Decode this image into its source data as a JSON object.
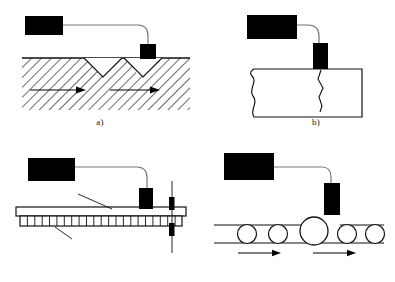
{
  "figure": {
    "width": 395,
    "height": 282,
    "background": "#ffffff",
    "ink": "#000000",
    "hatch_color": "#3a3a3a",
    "line_color": "#1a1a1a"
  },
  "panels": [
    {
      "id": "a",
      "caption": "a)",
      "description": "Eddy current probe over hatched material with two V-notches and flow arrows",
      "instrument_label": "instrument-box",
      "probe_label": "probe-block",
      "features": {
        "notch_count": 2,
        "arrow_count": 2,
        "hatching": "diagonal"
      }
    },
    {
      "id": "b",
      "caption": "b)",
      "description": "Probe over rectangular block with a vertical crack and wavy left edge",
      "instrument_label": "instrument-box",
      "probe_label": "probe-block",
      "features": {
        "crack_count": 1,
        "wavy_edge": "left"
      }
    },
    {
      "id": "c",
      "caption": "c)",
      "description": "Probe scanning a non-conductive layer bonded over a segmented conductive layer",
      "instrument_label": "instrument-box",
      "probe_label": "probe-block",
      "labels": {
        "upper": "非导体",
        "lower": "导体"
      },
      "features": {
        "segment_count": 22,
        "rod": "vertical-rod"
      }
    },
    {
      "id": "d",
      "caption": "d)",
      "description": "Probe above rolling spheres between two rails, one oversized sphere at center",
      "instrument_label": "instrument-box",
      "probe_label": "probe-block",
      "features": {
        "sphere_count": 5,
        "oversized_index": 2,
        "arrow_count": 2
      }
    }
  ]
}
